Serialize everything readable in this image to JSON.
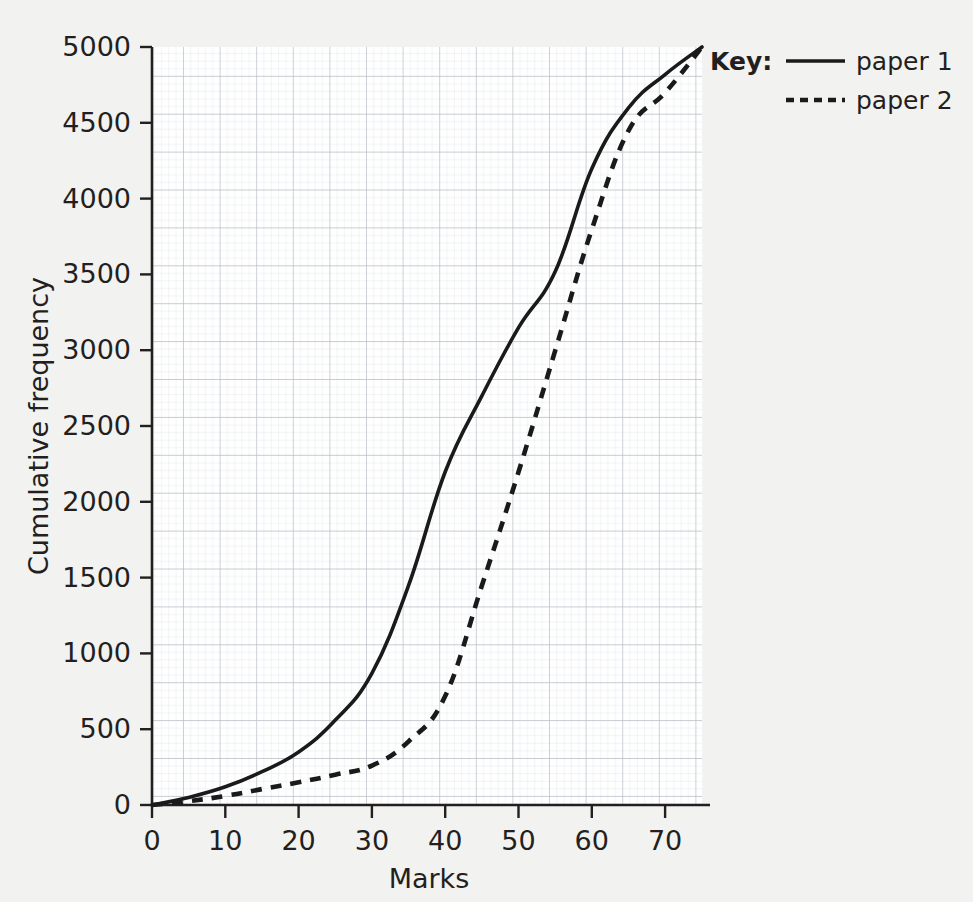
{
  "chart_data": {
    "type": "line",
    "title": "",
    "subtitle": "",
    "xlabel": "Marks",
    "ylabel": "Cumulative frequency",
    "xlim": [
      0,
      75
    ],
    "ylim": [
      0,
      5000
    ],
    "xticks": [
      0,
      10,
      20,
      30,
      40,
      50,
      60,
      70
    ],
    "xtick_labels": [
      "0",
      "10",
      "20",
      "30",
      "40",
      "50",
      "60",
      "70"
    ],
    "yticks": [
      0,
      500,
      1000,
      1500,
      2000,
      2500,
      3000,
      3500,
      4000,
      4500,
      5000
    ],
    "ytick_labels": [
      "0",
      "500",
      "1000",
      "1500",
      "2000",
      "2500",
      "3000",
      "3500",
      "4000",
      "4500",
      "5000"
    ],
    "grid": true,
    "grid_minor_step_x": 1,
    "grid_major_step_x": 5,
    "grid_minor_step_y": 50,
    "grid_major_step_y": 250,
    "legend_position": "top-right-outside",
    "legend_title": "Key:",
    "series": [
      {
        "name": "paper 1",
        "style": "solid",
        "color": "#1a1a1a",
        "x": [
          0,
          5,
          10,
          15,
          20,
          25,
          30,
          35,
          40,
          45,
          50,
          55,
          60,
          65,
          70,
          75
        ],
        "values": [
          0,
          50,
          120,
          220,
          350,
          560,
          870,
          1450,
          2200,
          2700,
          3150,
          3520,
          4200,
          4600,
          4820,
          5000
        ]
      },
      {
        "name": "paper 2",
        "style": "dashed",
        "color": "#1a1a1a",
        "x": [
          0,
          5,
          10,
          15,
          20,
          25,
          30,
          35,
          40,
          45,
          50,
          55,
          60,
          65,
          70,
          75
        ],
        "values": [
          0,
          25,
          60,
          105,
          150,
          200,
          260,
          420,
          720,
          1450,
          2200,
          3000,
          3800,
          4450,
          4700,
          5000
        ]
      }
    ]
  },
  "axes": {
    "y_axis_label": "Cumulative frequency",
    "x_axis_label": "Marks",
    "y_tick_0": "0",
    "y_tick_500": "500",
    "y_tick_1000": "1000",
    "y_tick_1500": "1500",
    "y_tick_2000": "2000",
    "y_tick_2500": "2500",
    "y_tick_3000": "3000",
    "y_tick_3500": "3500",
    "y_tick_4000": "4000",
    "y_tick_4500": "4500",
    "y_tick_5000": "5000",
    "x_tick_0": "0",
    "x_tick_10": "10",
    "x_tick_20": "20",
    "x_tick_30": "30",
    "x_tick_40": "40",
    "x_tick_50": "50",
    "x_tick_60": "60",
    "x_tick_70": "70"
  },
  "legend": {
    "title": "Key:",
    "entries": [
      {
        "label": "paper 1",
        "style": "solid"
      },
      {
        "label": "paper 2",
        "style": "dashed"
      }
    ],
    "entry_1_label": "paper 1",
    "entry_2_label": "paper 2"
  },
  "colors": {
    "background": "#f2f2f0",
    "plot_background": "#ffffff",
    "grid_minor": "#d8dce0",
    "grid_major": "#b8bec6",
    "axis": "#231f20",
    "series_1": "#1a1a1a",
    "series_2": "#1a1a1a",
    "text": "#231f20"
  }
}
